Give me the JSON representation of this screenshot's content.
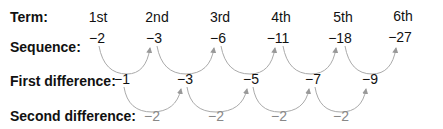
{
  "labels": {
    "term": "Term:",
    "sequence": "Sequence:",
    "first_difference": "First difference:",
    "second_difference": "Second difference:"
  },
  "terms": [
    "1st",
    "2nd",
    "3rd",
    "4th",
    "5th",
    "6th"
  ],
  "sequence": [
    "−2",
    "−3",
    "−6",
    "−11",
    "−18",
    "−27"
  ],
  "first_difference": [
    "−1",
    "−3",
    "−5",
    "−7",
    "−9"
  ],
  "second_difference": [
    "−2",
    "−2",
    "−2",
    "−2"
  ],
  "colors": {
    "text": "#111111",
    "arrow": "#999999",
    "second_diff": "#888888"
  }
}
